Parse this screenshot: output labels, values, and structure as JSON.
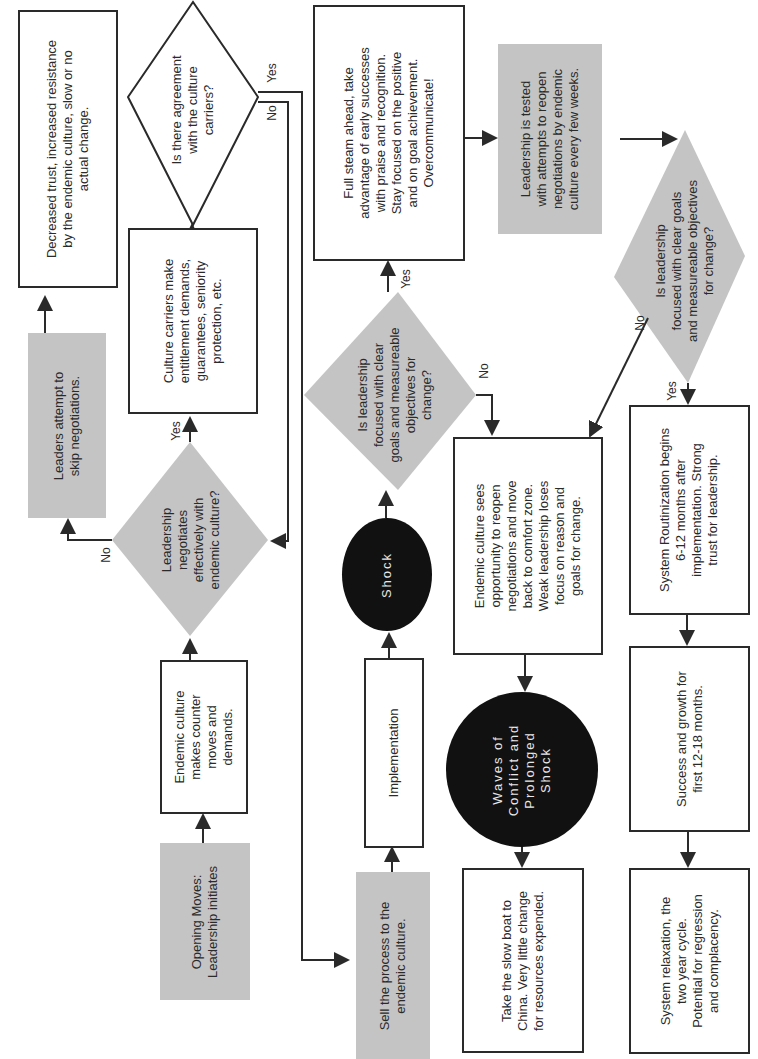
{
  "orientation": "rotated -90deg (read bottom-to-top)",
  "nodes": {
    "opening_moves": "Opening Moves:\nLeadership initiates",
    "counter_moves": "Endemic culture\nmakes counter\nmoves and\ndemands.",
    "negotiates_q": "Leadership\nnegotiates\neffectively with\nendemic culture?",
    "skip_negotiations": "Leaders attempt to\nskip negotiations.",
    "decreased_trust": "Decreased trust, increased resistance\nby the endemic culture, slow or no\nactual change.",
    "entitlement": "Culture carriers make\nentitlement demands,\nguarantees, seniority\nprotection,  etc.",
    "agreement_q": "Is there agreement\nwith the culture\ncarriers?",
    "sell_process": "Sell the process to the\nendemic culture.",
    "implementation": "Implementation",
    "shock": "Shock",
    "focused_q1": "Is leadership\nfocused with clear\ngoals and measureable\nobjectives for\nchange?",
    "full_steam": "Full steam ahead, take\nadvantage of early successes\nwith praise and recognition.\nStay focused on the positive\nand on goal achievement.\nOvercommunicate!",
    "tested": "Leadership is tested\nwith attempts to reopen\nnegotiations by endemic\nculture every few weeks.",
    "focused_q2": "Is leadership\nfocused with clear goals\nand measureable objectives\nfor change?",
    "reopen": "Endemic culture sees\nopportunity to reopen\nnegotiations and move\nback to comfort zone.\nWeak leadership loses\nfocus on reason and\ngoals for change.",
    "waves": "Waves  of\nConflict  and\nProlonged\nShock",
    "slow_boat": "Take the slow boat to\nChina.  Very little change\nfor resources expended.",
    "routinization": "System Routinization begins\n6-12  months  after\nimplementation.  Strong\ntrust for leadership.",
    "success": "Success and growth for\nfirst  12-18  months.",
    "relaxation": "System relaxation, the\ntwo year cycle.\nPotential for regression\nand complacency."
  },
  "labels": {
    "yes": "Yes",
    "no": "No"
  },
  "colors": {
    "gray_fill": "#c4c4c4",
    "oval_fill": "#111111",
    "line": "#2a2a2a"
  }
}
